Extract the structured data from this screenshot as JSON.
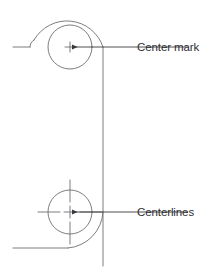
{
  "figure": {
    "background_color": "#ffffff",
    "line_color": "#6e6e72",
    "text_color": "#2e2e32",
    "width": 204,
    "height": 274
  },
  "annotations": [
    {
      "id": "center-mark",
      "label": "Center mark",
      "text_x": 137,
      "text_y": 51,
      "leader": {
        "from_x": 188,
        "from_y": 47,
        "to_x": 71,
        "to_y": 47,
        "arrow_at": "to"
      }
    },
    {
      "id": "centerlines",
      "label": "Centerlines",
      "text_x": 137,
      "text_y": 216,
      "leader": {
        "from_x": 188,
        "from_y": 212,
        "to_x": 71,
        "to_y": 212,
        "arrow_at": "to"
      }
    }
  ],
  "geometry": {
    "top_hole": {
      "center_x": 70,
      "center_y": 47,
      "radius": 22,
      "marker_type": "center-mark",
      "marker_arm_length": 5
    },
    "bottom_hole": {
      "center_x": 70,
      "center_y": 212,
      "radius": 22,
      "marker_type": "centerlines",
      "marker_arm_length": 32,
      "marker_gap": 4
    },
    "outline": {
      "top_edge_y": 47,
      "bottom_edge_y": 248,
      "left_edge_x": 13,
      "right_edge_x": 103,
      "outer_radius": 45,
      "fillet_radius": 8,
      "right_vertical_bottom_y": 266
    }
  }
}
